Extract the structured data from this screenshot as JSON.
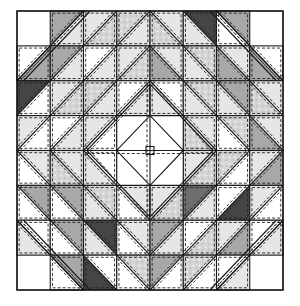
{
  "figure": {
    "title": ""
  },
  "frame": {
    "x": 17,
    "y": 11,
    "width": 266,
    "height": 279
  },
  "grid": {
    "cols": 8,
    "rows": 8
  },
  "palette": {
    "white": "#ffffff",
    "light": "#e6e6e6",
    "speckle": "#d4d4d4",
    "mid": "#a8a8a8",
    "dark": "#6e6e6e",
    "darkest": "#454545",
    "line": "#1a1a1a"
  },
  "cells": [
    [
      "C",
      "/ mid light",
      "/ light speckle",
      "/ speckle light",
      "\\ light speckle",
      "\\ darkest light",
      "\\ mid white",
      "C"
    ],
    [
      "/ white mid",
      "/ mid light",
      "/ white light",
      "/ light speckle",
      "\\ light mid",
      "\\ speckle light",
      "\\ light mid",
      "\\ white mid"
    ],
    [
      "/ darkest white",
      "/ light speckle",
      "/ speckle light",
      "/ white light",
      "\\ white light",
      "\\ speckle light",
      "\\ mid light",
      "\\ light speckle"
    ],
    [
      "/ light white",
      "/ white light",
      "/ light white",
      "P",
      "P",
      "\\ light speckle",
      "\\ speckle white",
      "\\ light mid"
    ],
    [
      "\\ light white",
      "\\ light speckle",
      "\\ white light",
      "P",
      "P",
      "/ light speckle",
      "/ speckle white",
      "/ light mid"
    ],
    [
      "\\ mid white",
      "\\ mid white",
      "\\ speckle light",
      "\\ light white",
      "/ light speckle",
      "/ dark light",
      "/ white darkest",
      "/ light white"
    ],
    [
      "\\ white light",
      "\\ mid white",
      "\\ darkest light",
      "\\ light white",
      "/ mid light",
      "/ white speckle",
      "/ light mid",
      "/ white light"
    ],
    [
      "C",
      "\\ mid white",
      "\\ white darkest",
      "\\ speckle white",
      "/ mid white",
      "/ speckle white",
      "/ white light",
      "C"
    ]
  ],
  "center_pinwheel": {
    "triangles": [
      {
        "name": "center-top-left-triangle",
        "fill": "white"
      },
      {
        "name": "center-top-right-triangle",
        "fill": "white"
      },
      {
        "name": "center-bottom-left-triangle",
        "fill": "white"
      },
      {
        "name": "center-bottom-right-triangle",
        "fill": "white"
      }
    ]
  },
  "corners": [
    {
      "name": "corner-top-left",
      "fill": "white"
    },
    {
      "name": "corner-top-right",
      "fill": "white"
    },
    {
      "name": "corner-bottom-left",
      "fill": "white"
    },
    {
      "name": "corner-bottom-right",
      "fill": "white"
    }
  ]
}
